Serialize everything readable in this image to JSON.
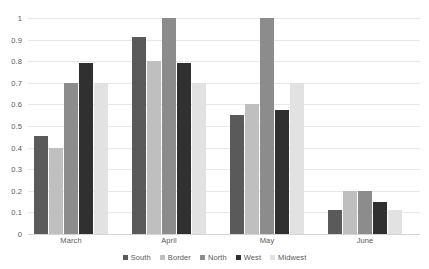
{
  "chart_data": {
    "type": "bar",
    "title": "",
    "xlabel": "",
    "ylabel": "",
    "categories": [
      "March",
      "April",
      "May",
      "June"
    ],
    "series": [
      {
        "name": "South",
        "color": "#5A5A5A",
        "values": [
          0.455,
          0.91,
          0.55,
          0.11
        ]
      },
      {
        "name": "Border",
        "color": "#BFBFBF",
        "values": [
          0.4,
          0.8,
          0.6,
          0.2
        ]
      },
      {
        "name": "North",
        "color": "#8C8C8C",
        "values": [
          0.7,
          1.0,
          1.0,
          0.2
        ]
      },
      {
        "name": "West",
        "color": "#303030",
        "values": [
          0.79,
          0.79,
          0.575,
          0.15
        ]
      },
      {
        "name": "Midwest",
        "color": "#E2E2E2",
        "values": [
          0.7,
          0.7,
          0.7,
          0.11
        ]
      }
    ],
    "ylim": [
      0,
      1
    ],
    "yticks": [
      "0",
      "0.1",
      "0.2",
      "0.3",
      "0.4",
      "0.5",
      "0.6",
      "0.7",
      "0.8",
      "0.9",
      "1"
    ],
    "ytick_values": [
      0,
      0.1,
      0.2,
      0.3,
      0.4,
      0.5,
      0.6,
      0.7,
      0.8,
      0.9,
      1
    ],
    "grid": true,
    "legend_position": "bottom"
  },
  "colors": {
    "gridline": "#e8e8e8",
    "baseline": "#d4d4d4",
    "text": "#595959",
    "background": "#ffffff"
  }
}
